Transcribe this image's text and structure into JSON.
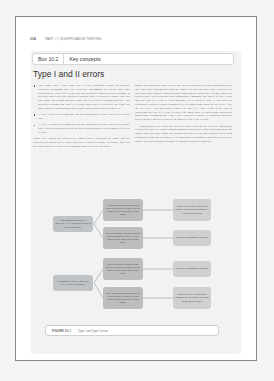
{
  "running_head": {
    "page_number": "334",
    "section": "PART 1 | SIGNIFICANCE TESTING"
  },
  "box": {
    "label": "Box 10.2",
    "title": "Key concepts",
    "section_title": "Type I and II errors",
    "left_column": [
      {
        "type": "bullet",
        "text": "The terms Type I error and Type II error frequently appear in statistics textbooks (although they are relatively uncommon in reports and other publications). They refer to the risk that no matter what decision you make in research based on your statistical analysis there is always a chance that you have made the wrong decision. There are two types of wrong decision – one involves deciding that there is a trend when there is in reality no trend, the other involves deciding that there is not a trend when in reality there is."
      },
      {
        "type": "bullet",
        "text": "A Type I error is deciding that the null hypothesis is false when it is actually true."
      },
      {
        "type": "bullet",
        "text": "A Type II error is deciding that the null hypothesis is true when it is actually false. Powerful statistical tests are those in which there is less chance of a Type II error."
      },
      {
        "type": "para",
        "text": "Figure 10.1 shows the process by which correct decisions are made and the processes by which Type I errors and Type II errors are made. Of course, these are not errors which it is easy to do anything about since the researcher"
      }
    ],
    "right_column": [
      {
        "type": "para",
        "text": "simply does not know what is truly the case in general (i.e. in the population) since they only have information from the sample of data that they have collected. So these are rather abstract concepts rather than concrete situations. You may have also noticed that if the researcher does something to minimise the risk of a Type I error then the risk of a Type II error increases. So to avoid a Type I error then the researcher could set a more stringent level of significance than the 5% level – say the 1% level – but this would reduce the risk of a Type I error at the cost of increasing the risk of a Type II error. The main issue in succeeding chapters is significance testing and the Type I error. However, Chapter 39 discusses statistical power which is greatly related to the matter of the Type II error."
      },
      {
        "type": "para",
        "text": "Unfortunately, the errors are not particularly useful in the everyday application of statistics where it is hard enough making a decision let alone worrying about the chance that you have made the wrong decision. Given that statistics deals with probabilities and not certainties, it is important to remember that there is always a chance that any decision you make is wrong in statistical analysis."
      }
    ],
    "diagram": {
      "root_nodes": [
        {
          "id": "no-trend",
          "text": "NO TREND EXISTS in REALITY (i.e. there is a trend in the population)"
        },
        {
          "id": "trend",
          "text": "A TREND EXISTS in REALITY (i.e. in the population)"
        }
      ],
      "decision_nodes": [
        {
          "id": "d1",
          "text": "The researcher decides that there is a trend in reality on the basis of the data used in the study"
        },
        {
          "id": "d2",
          "text": "The researcher decides that no trend exists in reality on the basis of the data used in the study"
        },
        {
          "id": "d3",
          "text": "The researcher decides that there is a trend in reality on the basis of the data used in the study"
        },
        {
          "id": "d4",
          "text": "The researcher decides that no trend exists in reality on the basis of the data used in the study"
        }
      ],
      "outcome_nodes": [
        {
          "id": "o1",
          "text": "Type I error: The researcher falsely concludes that there is a trend in the data"
        },
        {
          "id": "o2",
          "text": "This is a CORRECT decision"
        },
        {
          "id": "o3",
          "text": "This is a CORRECT decision"
        },
        {
          "id": "o4",
          "text": "This is a Type II error (see Chapter 39 on power) to know what can be done)"
        }
      ]
    },
    "caption": {
      "label": "FIGURE 10.1",
      "text": "Type I and Type II errors"
    }
  }
}
